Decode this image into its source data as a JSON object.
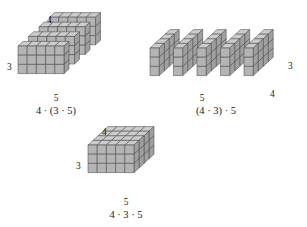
{
  "figure": {
    "colors": {
      "front_face": "#b4b4b4",
      "top_face": "#cccccc",
      "side_face": "#a0a0a0",
      "edge": "#4a4a4a",
      "outline": "#333333",
      "text": "#1a1a1a",
      "background": "#ffffff"
    }
  },
  "groups": {
    "left": {
      "expression": "4 · (3 · 5)",
      "dim_top": "4",
      "dim_left": "3",
      "dim_bottom": "5",
      "slab_count": 4,
      "slab_width": 5,
      "slab_height": 3
    },
    "right": {
      "expression": "(4 · 3) · 5",
      "dim_right": "3",
      "dim_bottom_left": "5",
      "dim_bottom_right": "4",
      "slab_count": 5,
      "slab_depth": 4,
      "slab_height": 3
    },
    "bottom": {
      "expression": "4 · 3 · 5",
      "dim_top": "4",
      "dim_left": "3",
      "dim_bottom": "5",
      "width": 5,
      "height": 3,
      "depth": 4
    }
  },
  "chart_data": {
    "type": "diagram",
    "panels": [
      {
        "label": "4 · (3 · 5)",
        "dims": [
          5,
          3,
          4
        ],
        "grouping": "four slabs of 3 by 5",
        "product": 60
      },
      {
        "label": "(4 · 3) · 5",
        "dims": [
          4,
          3,
          5
        ],
        "grouping": "five slabs of 4 by 3",
        "product": 60
      },
      {
        "label": "4 · 3 · 5",
        "dims": [
          5,
          3,
          4
        ],
        "grouping": "solid box",
        "product": 60
      }
    ]
  }
}
